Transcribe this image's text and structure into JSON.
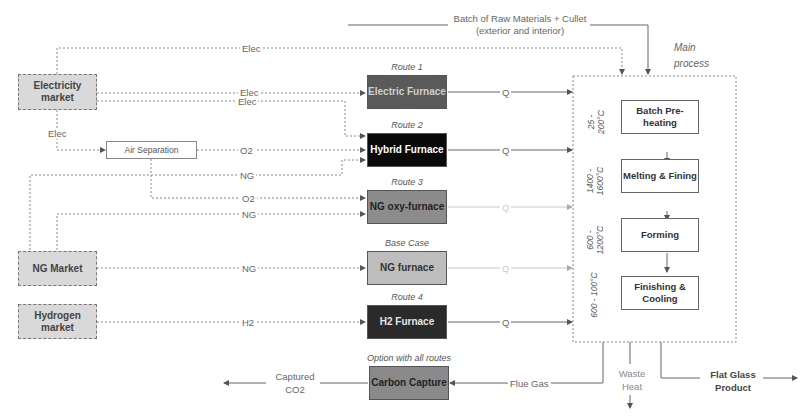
{
  "markets": {
    "electricity": "Electricity market",
    "ng": "NG Market",
    "hydrogen": "Hydrogen market"
  },
  "air_separation": "Air Separation",
  "furnaces": [
    {
      "route": "Route 1",
      "label": "Electric Furnace",
      "color": "#5a5a5a",
      "text_color": "#cfcfcf"
    },
    {
      "route": "Route 2",
      "label": "Hybrid Furnace",
      "color": "#0a0a0a",
      "text_color": "#ffffff"
    },
    {
      "route": "Route 3",
      "label": "NG oxy-furnace",
      "color": "#8c8c8c",
      "text_color": "#222222"
    },
    {
      "route": "Base Case",
      "label": "NG furnace",
      "color": "#bdbdbd",
      "text_color": "#333333"
    },
    {
      "route": "Route 4",
      "label": "H2 Furnace",
      "color": "#2a2a2a",
      "text_color": "#e6e6e6"
    }
  ],
  "carbon_capture": {
    "option": "Option with all routes",
    "label": "Carbon Capture",
    "color": "#8a8a8a"
  },
  "flows": {
    "elec_top": "Elec",
    "elec_r1": "Elec",
    "elec_r2": "Elec",
    "elec_air": "Elec",
    "o2_r2": "O2",
    "ng_r2": "NG",
    "o2_r3": "O2",
    "ng_r3": "NG",
    "ng_base": "NG",
    "h2_r4": "H2",
    "q": [
      "Q",
      "Q",
      "Q",
      "Q",
      "Q"
    ],
    "batch": "Batch of Raw Materials + Cullet (exterior and interior)",
    "flue_gas": "Flue Gas",
    "captured": "Captured CO2",
    "waste_heat": "Waste Heat",
    "product": "Flat Glass Product"
  },
  "main_process": {
    "title": "Main process",
    "steps": [
      {
        "label": "Batch Pre-heating",
        "temp": "25 - 200°C"
      },
      {
        "label": "Melting & Fining",
        "temp": "1400 - 1600°C"
      },
      {
        "label": "Forming",
        "temp": "600 - 1200°C"
      },
      {
        "label": "Finishing & Cooling",
        "temp": "600 - 100°C"
      }
    ]
  }
}
